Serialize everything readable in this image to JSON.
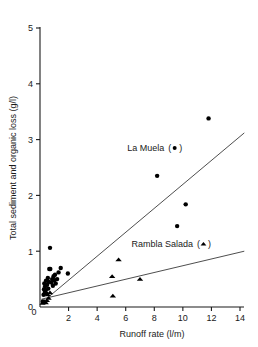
{
  "chart_data": {
    "type": "scatter",
    "title": "",
    "xlabel": "Runoff rate  (l/m)",
    "ylabel": "Total sediment and organic loss  (g/l)",
    "xlim": [
      0,
      14
    ],
    "ylim": [
      0,
      5
    ],
    "xticks": [
      0,
      2,
      4,
      6,
      8,
      10,
      12,
      14
    ],
    "xtick_labels": [
      "0",
      "2",
      "4",
      "6",
      "8",
      "10",
      "12",
      "14"
    ],
    "yticks": [
      0,
      1,
      2,
      3,
      4,
      5
    ],
    "ytick_labels": [
      "0",
      "1",
      "2",
      "3",
      "4",
      "5"
    ],
    "grid": false,
    "legend_position": "inside-plot-annotations",
    "series": [
      {
        "name": "La Muela",
        "marker": "circle",
        "label": "La Muela",
        "label_suffix": "(",
        "label_close": ")",
        "color": "#000000",
        "points": [
          [
            0.2,
            0.1
          ],
          [
            0.25,
            0.22
          ],
          [
            0.28,
            0.32
          ],
          [
            0.3,
            0.42
          ],
          [
            0.34,
            0.27
          ],
          [
            0.36,
            0.37
          ],
          [
            0.4,
            0.3
          ],
          [
            0.42,
            0.47
          ],
          [
            0.45,
            0.24
          ],
          [
            0.5,
            0.4
          ],
          [
            0.55,
            0.52
          ],
          [
            0.58,
            0.33
          ],
          [
            0.62,
            0.45
          ],
          [
            0.65,
            0.68
          ],
          [
            0.7,
            1.06
          ],
          [
            0.72,
            0.68
          ],
          [
            0.8,
            0.44
          ],
          [
            0.85,
            0.5
          ],
          [
            0.9,
            0.38
          ],
          [
            0.95,
            0.55
          ],
          [
            1.0,
            0.48
          ],
          [
            1.05,
            0.58
          ],
          [
            1.1,
            0.42
          ],
          [
            1.2,
            0.5
          ],
          [
            1.3,
            0.62
          ],
          [
            1.45,
            0.7
          ],
          [
            1.95,
            0.6
          ],
          [
            8.2,
            2.35
          ],
          [
            9.6,
            1.45
          ],
          [
            10.2,
            1.84
          ],
          [
            11.8,
            3.38
          ]
        ],
        "fit_line": {
          "x0": 0.6,
          "y0": 0.18,
          "x1": 14.3,
          "y1": 3.12
        }
      },
      {
        "name": "Rambla Salada",
        "marker": "triangle",
        "label": "Rambla Salada",
        "label_suffix": "(",
        "label_close": ")",
        "color": "#000000",
        "points": [
          [
            0.18,
            0.07
          ],
          [
            0.3,
            0.1
          ],
          [
            0.4,
            0.08
          ],
          [
            0.48,
            0.12
          ],
          [
            0.55,
            0.22
          ],
          [
            0.6,
            0.16
          ],
          [
            0.7,
            0.26
          ],
          [
            5.05,
            0.55
          ],
          [
            5.5,
            0.85
          ],
          [
            5.1,
            0.2
          ],
          [
            7.0,
            0.5
          ]
        ],
        "fit_line": {
          "x0": 0.1,
          "y0": 0.14,
          "x1": 14.3,
          "y1": 1.0
        }
      }
    ],
    "annotations": [
      {
        "name": "la-muela-annotation",
        "text": "La Muela",
        "glyph": "circle",
        "x": 6.1,
        "y": 2.85
      },
      {
        "name": "rambla-salada-annotation",
        "text": "Rambla Salada",
        "glyph": "triangle",
        "x": 6.4,
        "y": 1.13
      }
    ]
  }
}
